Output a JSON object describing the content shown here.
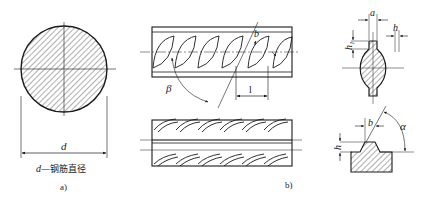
{
  "figure_a": {
    "dimension_label": "d",
    "legend": "d—钢筋直径",
    "legend_var": "d",
    "legend_text": "—钢筋直径",
    "caption": "a)"
  },
  "figure_b": {
    "angle_beta": "β",
    "angle_b": "b",
    "pitch_label": "l",
    "caption": "b)"
  },
  "figure_c": {
    "label_a": "a",
    "label_h": "h",
    "label_h1": "h₁"
  },
  "figure_d": {
    "label_b": "b",
    "label_alpha": "α",
    "label_h": "h"
  }
}
